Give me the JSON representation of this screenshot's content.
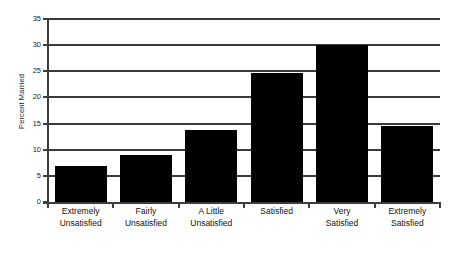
{
  "chart_data": {
    "type": "bar",
    "title": "",
    "subtitle": "",
    "xlabel": "",
    "ylabel": "Percent Married",
    "ylim": [
      0,
      35
    ],
    "yticks": [
      0,
      5,
      10,
      15,
      20,
      25,
      30,
      35
    ],
    "ytick_labels": [
      "0",
      "5",
      "10",
      "15",
      "20",
      "25",
      "30",
      "35"
    ],
    "grid": "horizontal",
    "legend": "none",
    "orientation": "vertical",
    "bar_color": "#000000",
    "background_color": "#ffffff",
    "axis_color": "#3d3d3d",
    "categories": [
      "Extremely Unsatisfied",
      "Fairly Unsatisfied",
      "A Little Unsatisfied",
      "Satisfied",
      "Very Satisfied",
      "Extremely Satisfied"
    ],
    "category_label_lines": [
      [
        "Extremely",
        "Unsatisfied"
      ],
      [
        "Fairly",
        "Unsatisfied"
      ],
      [
        "A Little",
        "Unsatisfied"
      ],
      [
        "Satisfied",
        ""
      ],
      [
        "Very",
        "Satisfied"
      ],
      [
        "Extremely",
        "Satisfied"
      ]
    ],
    "values": [
      6.9,
      8.9,
      13.8,
      24.6,
      30.1,
      14.5
    ]
  }
}
